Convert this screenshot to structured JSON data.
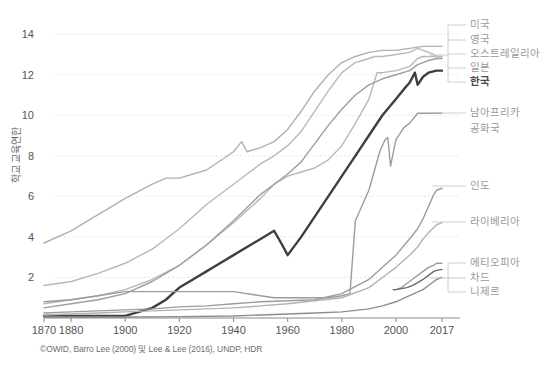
{
  "axes": {
    "y_title": "학교 교육연한",
    "y_ticks": [
      "14",
      "12",
      "10",
      "8",
      "6",
      "4",
      "2"
    ],
    "y_values": [
      14,
      12,
      10,
      8,
      6,
      4,
      2
    ],
    "x_ticks": [
      "1870",
      "1880",
      "1900",
      "1920",
      "1940",
      "1960",
      "1980",
      "2000",
      "2017"
    ],
    "x_values": [
      1870,
      1880,
      1900,
      1920,
      1940,
      1960,
      1980,
      2000,
      2017
    ]
  },
  "footer": {
    "credit": "©OWID, Barro Lee (2000) 및 Lee & Lee (2016), UNDP, HDR"
  },
  "legend": {
    "items": [
      {
        "label": "미국",
        "color": "#b4b4b4",
        "highlight": false
      },
      {
        "label": "영국",
        "color": "#b4b4b4",
        "highlight": false
      },
      {
        "label": "오스트레일리아",
        "color": "#b4b4b4",
        "highlight": false
      },
      {
        "label": "일본",
        "color": "#b4b4b4",
        "highlight": false
      },
      {
        "label": "한국",
        "color": "#4a4a4a",
        "highlight": true
      },
      {
        "label": "남아프리카",
        "color": "#b4b4b4",
        "highlight": false
      },
      {
        "label": "공화국",
        "color": "#b4b4b4",
        "highlight": false
      },
      {
        "label": "인도",
        "color": "#b4b4b4",
        "highlight": false
      },
      {
        "label": "라이베리아",
        "color": "#b4b4b4",
        "highlight": false
      },
      {
        "label": "에티오피아",
        "color": "#b4b4b4",
        "highlight": false
      },
      {
        "label": "차드",
        "color": "#6a6a6a",
        "highlight": false
      },
      {
        "label": "니제르",
        "color": "#b4b4b4",
        "highlight": false
      }
    ]
  },
  "chart_data": {
    "type": "line",
    "title": "",
    "xlabel": "",
    "ylabel": "학교 교육연한",
    "xlim": [
      1870,
      2017
    ],
    "ylim": [
      0,
      14.6
    ],
    "grid": true,
    "legend_position": "right-inline-labels",
    "series": [
      {
        "name": "미국",
        "color": "#b0b0b0",
        "width": 1.4,
        "x": [
          1870,
          1880,
          1890,
          1900,
          1910,
          1915,
          1920,
          1930,
          1940,
          1943,
          1945,
          1950,
          1955,
          1960,
          1965,
          1970,
          1975,
          1980,
          1985,
          1990,
          1995,
          2000,
          2005,
          2010,
          2013,
          2015,
          2017
        ],
        "y": [
          3.7,
          4.3,
          5.1,
          5.9,
          6.6,
          6.9,
          6.9,
          7.3,
          8.2,
          8.7,
          8.2,
          8.4,
          8.7,
          9.3,
          10.2,
          11.2,
          12.0,
          12.6,
          12.9,
          13.1,
          13.2,
          13.2,
          13.3,
          13.4,
          13.4,
          13.4,
          13.4
        ]
      },
      {
        "name": "영국",
        "color": "#b8b8b8",
        "width": 1.4,
        "x": [
          1870,
          1880,
          1890,
          1900,
          1910,
          1920,
          1930,
          1940,
          1950,
          1955,
          1960,
          1965,
          1970,
          1975,
          1980,
          1985,
          1990,
          1992,
          1995,
          2000,
          2005,
          2008,
          2010,
          2012,
          2014,
          2015,
          2017
        ],
        "y": [
          1.6,
          1.8,
          2.2,
          2.7,
          3.4,
          4.4,
          5.6,
          6.6,
          7.6,
          8.0,
          8.5,
          9.2,
          10.2,
          11.2,
          12.1,
          12.6,
          12.8,
          12.9,
          12.9,
          13.0,
          13.1,
          13.3,
          13.2,
          13.1,
          13.0,
          12.9,
          12.9
        ]
      },
      {
        "name": "오스트레일리아",
        "color": "#b8b8b8",
        "width": 1.4,
        "x": [
          1870,
          1880,
          1890,
          1900,
          1910,
          1920,
          1930,
          1940,
          1950,
          1955,
          1960,
          1965,
          1970,
          1975,
          1980,
          1985,
          1990,
          1993,
          1995,
          2000,
          2005,
          2008,
          2010,
          2012,
          2015,
          2017
        ],
        "y": [
          0.7,
          0.9,
          1.1,
          1.4,
          1.9,
          2.6,
          3.6,
          4.7,
          5.9,
          6.6,
          7.0,
          7.2,
          7.4,
          7.8,
          8.5,
          9.6,
          10.8,
          12.1,
          12.1,
          12.2,
          12.4,
          12.8,
          12.9,
          12.9,
          12.9,
          12.9
        ]
      },
      {
        "name": "일본",
        "color": "#9e9e9e",
        "width": 1.4,
        "x": [
          1870,
          1880,
          1890,
          1900,
          1910,
          1920,
          1930,
          1940,
          1950,
          1955,
          1960,
          1965,
          1970,
          1975,
          1980,
          1985,
          1990,
          1995,
          2000,
          2005,
          2008,
          2010,
          2012,
          2015,
          2017
        ],
        "y": [
          0.5,
          0.7,
          0.9,
          1.2,
          1.8,
          2.6,
          3.6,
          4.8,
          6.1,
          6.6,
          7.1,
          7.7,
          8.6,
          9.5,
          10.3,
          11.0,
          11.5,
          11.8,
          12.0,
          12.2,
          12.5,
          12.6,
          12.7,
          12.8,
          12.8
        ]
      },
      {
        "name": "한국",
        "color": "#3f3f3f",
        "width": 2.4,
        "x": [
          1870,
          1890,
          1900,
          1910,
          1915,
          1920,
          1925,
          1930,
          1935,
          1940,
          1945,
          1950,
          1955,
          1958,
          1960,
          1965,
          1970,
          1975,
          1980,
          1985,
          1990,
          1995,
          2000,
          2003,
          2005,
          2007,
          2008,
          2010,
          2012,
          2015,
          2017
        ],
        "y": [
          0.1,
          0.1,
          0.1,
          0.5,
          0.9,
          1.5,
          1.9,
          2.3,
          2.7,
          3.1,
          3.5,
          3.9,
          4.3,
          3.6,
          3.1,
          4.0,
          5.0,
          6.0,
          7.0,
          8.0,
          9.0,
          10.0,
          10.8,
          11.3,
          11.6,
          12.1,
          11.5,
          11.9,
          12.1,
          12.2,
          12.2
        ]
      },
      {
        "name": "남아프리카 공화국",
        "color": "#9c9c9c",
        "width": 1.4,
        "x": [
          1870,
          1880,
          1890,
          1900,
          1910,
          1920,
          1930,
          1940,
          1950,
          1955,
          1960,
          1965,
          1970,
          1975,
          1980,
          1983,
          1985,
          1990,
          1994,
          1996,
          1997,
          1998,
          2000,
          2003,
          2005,
          2008,
          2010,
          2012,
          2015,
          2017
        ],
        "y": [
          0.8,
          0.9,
          1.1,
          1.3,
          1.3,
          1.3,
          1.3,
          1.3,
          1.1,
          1.0,
          1.0,
          1.0,
          1.0,
          1.0,
          1.1,
          1.2,
          4.8,
          6.3,
          8.2,
          8.8,
          8.9,
          7.5,
          8.8,
          9.4,
          9.6,
          10.1,
          10.1,
          10.1,
          10.1,
          10.1
        ]
      },
      {
        "name": "인도",
        "color": "#9c9c9c",
        "width": 1.4,
        "x": [
          1870,
          1880,
          1890,
          1900,
          1910,
          1920,
          1930,
          1940,
          1950,
          1960,
          1970,
          1980,
          1990,
          1995,
          2000,
          2005,
          2008,
          2010,
          2012,
          2014,
          2015,
          2017
        ],
        "y": [
          0.25,
          0.3,
          0.35,
          0.4,
          0.45,
          0.55,
          0.6,
          0.7,
          0.8,
          0.85,
          0.9,
          1.2,
          1.9,
          2.5,
          3.1,
          3.9,
          4.4,
          4.9,
          5.5,
          6.1,
          6.3,
          6.4
        ]
      },
      {
        "name": "라이베리아",
        "color": "#b2b2b2",
        "width": 1.4,
        "x": [
          1870,
          1880,
          1890,
          1900,
          1910,
          1920,
          1930,
          1940,
          1950,
          1960,
          1970,
          1980,
          1990,
          1995,
          2000,
          2005,
          2008,
          2010,
          2012,
          2015,
          2017
        ],
        "y": [
          0.15,
          0.2,
          0.25,
          0.3,
          0.35,
          0.4,
          0.45,
          0.5,
          0.6,
          0.7,
          0.85,
          1.0,
          1.5,
          2.0,
          2.5,
          3.1,
          3.5,
          3.9,
          4.2,
          4.6,
          4.7
        ]
      },
      {
        "name": "에티오피아",
        "color": "#9c9c9c",
        "width": 1.4,
        "x": [
          1999,
          2000,
          2002,
          2004,
          2006,
          2008,
          2010,
          2012,
          2014,
          2015,
          2017
        ],
        "y": [
          1.4,
          1.4,
          1.5,
          1.7,
          1.9,
          2.1,
          2.3,
          2.5,
          2.6,
          2.7,
          2.7
        ]
      },
      {
        "name": "차드",
        "color": "#6a6a6a",
        "width": 1.4,
        "x": [
          1999,
          2000,
          2002,
          2004,
          2006,
          2008,
          2010,
          2012,
          2014,
          2015,
          2017
        ],
        "y": [
          1.4,
          1.4,
          1.45,
          1.5,
          1.6,
          1.75,
          1.9,
          2.1,
          2.3,
          2.35,
          2.4
        ]
      },
      {
        "name": "니제르",
        "color": "#8d8d8d",
        "width": 1.4,
        "x": [
          1870,
          1900,
          1920,
          1940,
          1960,
          1970,
          1980,
          1990,
          1995,
          2000,
          2005,
          2010,
          2012,
          2015,
          2017
        ],
        "y": [
          0.05,
          0.05,
          0.07,
          0.1,
          0.2,
          0.25,
          0.3,
          0.45,
          0.6,
          0.8,
          1.1,
          1.4,
          1.6,
          1.9,
          2.0
        ]
      }
    ]
  }
}
